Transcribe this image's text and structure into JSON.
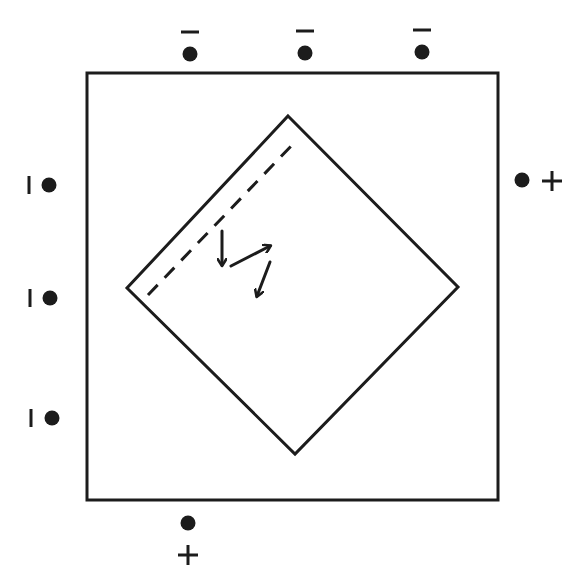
{
  "diagram": {
    "colors": {
      "stroke": "#1c1c1c",
      "background": "#ffffff"
    },
    "outer_square": {
      "x1": 87,
      "y1": 73,
      "x2": 498,
      "y2": 500
    },
    "diamond": {
      "top": [
        288,
        116
      ],
      "right": [
        458,
        287
      ],
      "bottom": [
        295,
        454
      ],
      "left": [
        127,
        288
      ]
    },
    "dashed_line": {
      "from": [
        148,
        295
      ],
      "to": [
        294,
        143
      ]
    },
    "arrows": [
      {
        "name": "arrow-down",
        "from": [
          222,
          231
        ],
        "to": [
          222,
          265
        ]
      },
      {
        "name": "arrow-up-right",
        "from": [
          231,
          266
        ],
        "to": [
          270,
          246
        ]
      },
      {
        "name": "arrow-down-left",
        "from": [
          270,
          262
        ],
        "to": [
          257,
          296
        ]
      }
    ],
    "charges": [
      {
        "id": "top-1",
        "dot": [
          190,
          54
        ],
        "sign": "-",
        "sign_pos": [
          190,
          32
        ],
        "orientation": "horizontal"
      },
      {
        "id": "top-2",
        "dot": [
          305,
          53
        ],
        "sign": "-",
        "sign_pos": [
          305,
          31
        ],
        "orientation": "horizontal"
      },
      {
        "id": "top-3",
        "dot": [
          422,
          52
        ],
        "sign": "-",
        "sign_pos": [
          422,
          30
        ],
        "orientation": "horizontal"
      },
      {
        "id": "left-1",
        "dot": [
          49,
          185
        ],
        "sign": "-",
        "sign_pos": [
          29,
          185
        ],
        "orientation": "vertical"
      },
      {
        "id": "left-2",
        "dot": [
          50,
          298
        ],
        "sign": "-",
        "sign_pos": [
          30,
          298
        ],
        "orientation": "vertical"
      },
      {
        "id": "left-3",
        "dot": [
          52,
          418
        ],
        "sign": "-",
        "sign_pos": [
          31,
          418
        ],
        "orientation": "vertical"
      },
      {
        "id": "right-1",
        "dot": [
          522,
          180
        ],
        "sign": "+",
        "sign_pos": [
          552,
          181
        ],
        "orientation": "horizontal"
      },
      {
        "id": "bottom-1",
        "dot": [
          188,
          523
        ],
        "sign": "+",
        "sign_pos": [
          188,
          555
        ],
        "orientation": "horizontal"
      }
    ]
  }
}
